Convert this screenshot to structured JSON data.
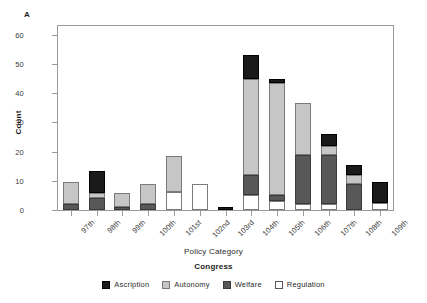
{
  "panel": {
    "letter": "A"
  },
  "axes": {
    "ylabel": "Count",
    "xlabel": "Congress",
    "yticks": [
      "0",
      "10",
      "20",
      "30",
      "40",
      "50",
      "60"
    ]
  },
  "legend": {
    "title": "Policy Category",
    "items": [
      {
        "label": "Ascription",
        "key": "ascription",
        "color": "#1a1a1a"
      },
      {
        "label": "Autonomy",
        "key": "autonomy",
        "color": "#c6c6c6"
      },
      {
        "label": "Welfare",
        "key": "welfare",
        "color": "#585858"
      },
      {
        "label": "Regulation",
        "key": "regulation",
        "color": "#ffffff"
      }
    ]
  },
  "chart_data": {
    "type": "bar",
    "title": "",
    "subtitle": "",
    "stacked": true,
    "xlabel": "Congress",
    "ylabel": "Count",
    "ylim": [
      0,
      63
    ],
    "yticks": [
      0,
      10,
      20,
      30,
      40,
      50,
      60
    ],
    "grid": false,
    "legend_title": "Policy Category",
    "legend_position": "bottom",
    "categories": [
      "97th",
      "98th",
      "99th",
      "100th",
      "101st",
      "102nd",
      "103rd",
      "104th",
      "105th",
      "106th",
      "107th",
      "108th",
      "109th"
    ],
    "series": [
      {
        "name": "Regulation",
        "color": "#ffffff",
        "values": [
          0,
          0,
          0,
          0,
          6,
          9,
          0,
          5,
          3,
          2,
          2,
          0,
          2.5
        ]
      },
      {
        "name": "Welfare",
        "color": "#585858",
        "values": [
          2,
          4,
          1,
          2,
          0,
          0,
          0,
          7,
          2,
          17,
          17,
          9,
          0
        ]
      },
      {
        "name": "Autonomy",
        "color": "#c6c6c6",
        "values": [
          7.5,
          2,
          5,
          7,
          12.5,
          0,
          0,
          33,
          38.5,
          17.5,
          3,
          3,
          0
        ]
      },
      {
        "name": "Ascription",
        "color": "#1a1a1a",
        "values": [
          0,
          7.5,
          0,
          0,
          0,
          0,
          1,
          8,
          1.5,
          0,
          4,
          3.5,
          7
        ]
      }
    ],
    "totals": [
      9.5,
      13.5,
      6,
      9,
      18.5,
      9,
      1,
      53,
      45,
      36.5,
      26,
      15.5,
      9.5
    ]
  }
}
